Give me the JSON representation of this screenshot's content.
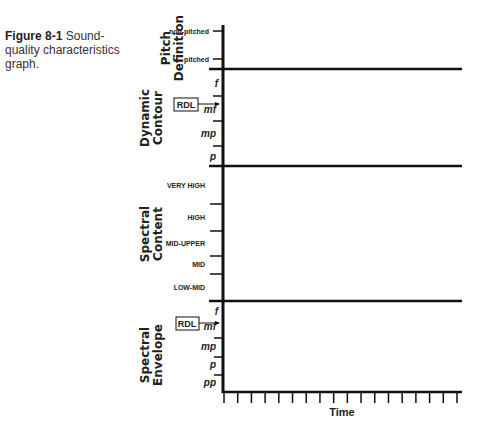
{
  "caption": {
    "figure_number": "Figure 8-1",
    "text": "Sound-quality characteristics graph."
  },
  "sections": [
    {
      "title_line1": "Pitch",
      "title_line2": "Definition",
      "ticks": [
        "non-pitched",
        "pitched"
      ]
    },
    {
      "title_line1": "Dynamic",
      "title_line2": "Contour",
      "ticks": [
        "f",
        "mf",
        "mp",
        "p"
      ],
      "marker": "RDL"
    },
    {
      "title_line1": "Spectral",
      "title_line2": "Content",
      "ticks": [
        "VERY HIGH",
        "HIGH",
        "MID-UPPER",
        "MID",
        "LOW-MID"
      ]
    },
    {
      "title_line1": "Spectral",
      "title_line2": "Envelope",
      "ticks": [
        "f",
        "mf",
        "mp",
        "p",
        "pp"
      ],
      "marker": "RDL"
    }
  ],
  "x_axis": {
    "label": "Time",
    "tick_count": 18
  },
  "chart_data": {
    "type": "table",
    "title": "Sound-quality characteristics graph",
    "xlabel": "Time",
    "panels": [
      {
        "name": "Pitch Definition",
        "levels": [
          "non-pitched",
          "pitched"
        ]
      },
      {
        "name": "Dynamic Contour",
        "levels": [
          "f",
          "mf",
          "mp",
          "p"
        ],
        "annotation": {
          "label": "RDL",
          "points_to": "mf"
        }
      },
      {
        "name": "Spectral Content",
        "levels": [
          "VERY HIGH",
          "HIGH",
          "MID-UPPER",
          "MID",
          "LOW-MID"
        ]
      },
      {
        "name": "Spectral Envelope",
        "levels": [
          "f",
          "mf",
          "mp",
          "p",
          "pp"
        ],
        "annotation": {
          "label": "RDL",
          "points_to": "mf"
        }
      }
    ],
    "time_ticks": 18
  }
}
